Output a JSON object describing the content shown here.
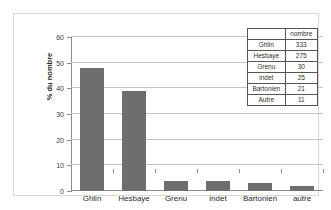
{
  "chart_data": {
    "type": "bar",
    "title": "",
    "subtitle": "",
    "xlabel": "",
    "ylabel": "% du nombre",
    "categories": [
      "Ghlin",
      "Hesbaye",
      "Grenu",
      "indet",
      "Bartonien",
      "autre"
    ],
    "values": [
      48,
      39,
      4,
      4,
      3,
      2
    ],
    "ylim": [
      0,
      60
    ],
    "yticks": [
      0,
      10,
      20,
      30,
      40,
      50,
      60
    ],
    "grid": true,
    "legend": false,
    "bar_color": "#6e6e6e",
    "series": [
      {
        "name": "% du nombre",
        "values": [
          48,
          39,
          4,
          4,
          3,
          2
        ]
      }
    ]
  },
  "data_table": {
    "corner_label": "",
    "header": "nombre",
    "rows": [
      {
        "label": "Ghlin",
        "value": "333"
      },
      {
        "label": "Hesbaye",
        "value": "275"
      },
      {
        "label": "Grenu",
        "value": "30"
      },
      {
        "label": "indet",
        "value": "25"
      },
      {
        "label": "Bartonien",
        "value": "21"
      },
      {
        "label": "Autre",
        "value": "11"
      }
    ]
  }
}
